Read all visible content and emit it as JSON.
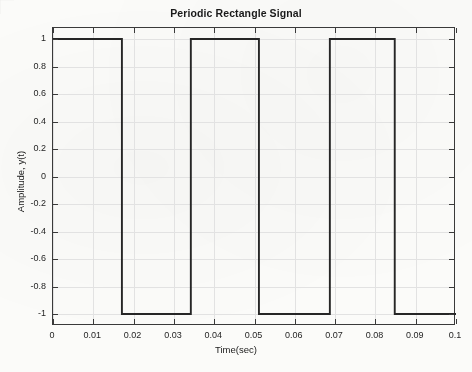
{
  "figure": {
    "title": "Periodic Rectangle Signal",
    "caption_fragment": ""
  },
  "axes": {
    "x_title": "Time(sec)",
    "y_title": "Amplitude, y(t)",
    "x_ticks": [
      "0",
      "0.01",
      "0.02",
      "0.03",
      "0.04",
      "0.05",
      "0.06",
      "0.07",
      "0.08",
      "0.09",
      "0.1"
    ],
    "y_ticks": [
      "1",
      "0.8",
      "0.6",
      "0.4",
      "0.2",
      "0",
      "-0.2",
      "-0.4",
      "-0.6",
      "-0.8",
      "-1"
    ]
  },
  "style": {
    "line_color": "#262626",
    "axis_color": "#3a3a3a",
    "grid_color": "#e2e2e2",
    "background": "#fbfbf9"
  },
  "chart_data": {
    "type": "line",
    "title": "Periodic Rectangle Signal",
    "xlabel": "Time(sec)",
    "ylabel": "Amplitude, y(t)",
    "xlim": [
      0,
      0.1
    ],
    "ylim": [
      -1,
      1
    ],
    "xticks": [
      0,
      0.01,
      0.02,
      0.03,
      0.04,
      0.05,
      0.06,
      0.07,
      0.08,
      0.09,
      0.1
    ],
    "yticks": [
      -1,
      -0.8,
      -0.6,
      -0.4,
      -0.2,
      0,
      0.2,
      0.4,
      0.6,
      0.8,
      1
    ],
    "grid": true,
    "legend": null,
    "waveform": {
      "shape": "rectangular",
      "amplitude": 1,
      "low_level": -1,
      "high_level": 1,
      "period": 0.034,
      "duty_cycle": 0.5,
      "initial_level": 1,
      "transitions": [
        0.0171,
        0.0342,
        0.0511,
        0.0687,
        0.0848
      ]
    },
    "series": [
      {
        "name": "y(t)",
        "x": [
          0,
          0.0171,
          0.0171,
          0.0342,
          0.0342,
          0.0511,
          0.0511,
          0.0687,
          0.0687,
          0.0848,
          0.0848,
          0.1
        ],
        "values": [
          1,
          1,
          -1,
          -1,
          1,
          1,
          -1,
          -1,
          1,
          1,
          -1,
          -1
        ]
      }
    ]
  }
}
